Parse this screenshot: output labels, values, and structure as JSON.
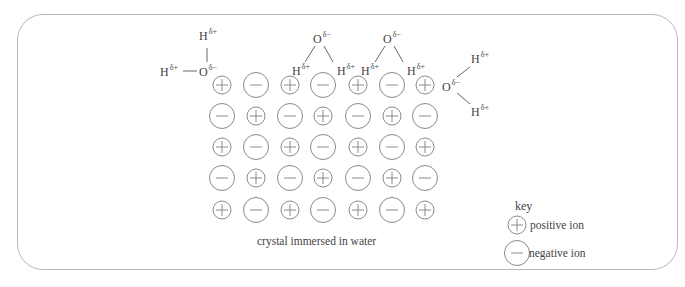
{
  "diagram": {
    "caption": "crystal immersed in water",
    "grid": {
      "rows": 5,
      "cols": 7,
      "pattern": [
        [
          "+",
          "-",
          "+",
          "-",
          "+",
          "-",
          "+"
        ],
        [
          "-",
          "+",
          "-",
          "+",
          "-",
          "+",
          "-"
        ],
        [
          "+",
          "-",
          "+",
          "-",
          "+",
          "-",
          "+"
        ],
        [
          "-",
          "+",
          "-",
          "+",
          "-",
          "+",
          "-"
        ],
        [
          "+",
          "-",
          "+",
          "-",
          "+",
          "-",
          "+"
        ]
      ]
    },
    "water_molecules": [
      {
        "id": "left",
        "oxygen": {
          "label": "O",
          "charge": "δ−"
        },
        "hydrogens": [
          {
            "label": "H",
            "charge": "δ+"
          },
          {
            "label": "H",
            "charge": "δ+"
          }
        ]
      },
      {
        "id": "top-middle",
        "oxygen": {
          "label": "O",
          "charge": "δ−"
        },
        "hydrogens": [
          {
            "label": "H",
            "charge": "δ+"
          },
          {
            "label": "H",
            "charge": "δ+"
          }
        ]
      },
      {
        "id": "top-right",
        "oxygen": {
          "label": "O",
          "charge": "δ−"
        },
        "hydrogens": [
          {
            "label": "H",
            "charge": "δ+"
          },
          {
            "label": "H",
            "charge": "δ+"
          }
        ]
      },
      {
        "id": "right",
        "oxygen": {
          "label": "O",
          "charge": "δ−"
        },
        "hydrogens": [
          {
            "label": "H",
            "charge": "δ+"
          },
          {
            "label": "H",
            "charge": "δ+"
          }
        ]
      }
    ],
    "key": {
      "title": "key",
      "items": [
        {
          "symbol": "+",
          "label": "positive ion"
        },
        {
          "symbol": "-",
          "label": "negative ion"
        }
      ]
    },
    "colors": {
      "stroke": "#8a8a8a",
      "frame": "#b8b8b8",
      "text": "#444444"
    }
  }
}
